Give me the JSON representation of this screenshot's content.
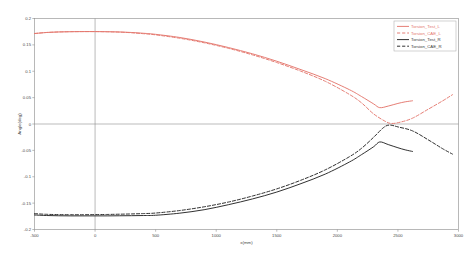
{
  "chart_data": {
    "type": "line",
    "title": "",
    "xlabel": "x(mm)",
    "ylabel": "Angle(deg)",
    "xlim": [
      -500,
      3000
    ],
    "ylim": [
      -0.2,
      0.2
    ],
    "xticks": [
      "-500",
      "0",
      "500",
      "1000",
      "1500",
      "2000",
      "2500",
      "3000"
    ],
    "xtick_values": [
      -500,
      0,
      500,
      1000,
      1500,
      2000,
      2500,
      3000
    ],
    "yticks": [
      "0.2",
      "0.15",
      "0.1",
      "0.05",
      "0",
      "-0.05",
      "-0.1",
      "-0.15",
      "-0.2"
    ],
    "ytick_values": [
      0.2,
      0.15,
      0.1,
      0.05,
      0,
      -0.05,
      -0.1,
      -0.15,
      -0.2
    ],
    "grid": false,
    "legend_position": "top-right",
    "zero_line": true,
    "series": [
      {
        "name": "Torsion_Test_L",
        "color": "#e4776e",
        "style": "solid",
        "x": [
          -500,
          -400,
          -300,
          -200,
          -100,
          0,
          100,
          200,
          300,
          400,
          500,
          700,
          900,
          1100,
          1300,
          1500,
          1700,
          1900,
          2100,
          2200,
          2300,
          2350,
          2420,
          2500,
          2560,
          2620
        ],
        "y": [
          0.1715,
          0.1735,
          0.1745,
          0.175,
          0.1752,
          0.1752,
          0.175,
          0.1745,
          0.1735,
          0.172,
          0.17,
          0.164,
          0.1555,
          0.145,
          0.133,
          0.119,
          0.103,
          0.086,
          0.065,
          0.052,
          0.038,
          0.031,
          0.034,
          0.039,
          0.042,
          0.044
        ]
      },
      {
        "name": "Torsion_CAE_L",
        "color": "#e4776e",
        "style": "dashed",
        "x": [
          -500,
          -400,
          -300,
          -200,
          -100,
          0,
          100,
          200,
          300,
          400,
          500,
          700,
          900,
          1100,
          1300,
          1500,
          1700,
          1900,
          2100,
          2200,
          2300,
          2400,
          2450,
          2520,
          2620,
          2750,
          2870,
          2950
        ],
        "y": [
          0.1715,
          0.1735,
          0.1745,
          0.175,
          0.1752,
          0.1752,
          0.1748,
          0.1742,
          0.173,
          0.1712,
          0.169,
          0.1625,
          0.154,
          0.1435,
          0.131,
          0.1165,
          0.1,
          0.081,
          0.056,
          0.04,
          0.019,
          0.0045,
          0.001,
          0.0035,
          0.011,
          0.028,
          0.044,
          0.0555
        ]
      },
      {
        "name": "Torsion_Test_R",
        "color": "#262626",
        "style": "solid",
        "x": [
          -500,
          -400,
          -300,
          -200,
          -100,
          0,
          100,
          200,
          300,
          400,
          500,
          700,
          900,
          1100,
          1300,
          1500,
          1700,
          1900,
          2100,
          2200,
          2300,
          2350,
          2420,
          2500,
          2560,
          2620
        ],
        "y": [
          -0.1725,
          -0.1735,
          -0.174,
          -0.1742,
          -0.1742,
          -0.1742,
          -0.1742,
          -0.174,
          -0.1738,
          -0.1735,
          -0.173,
          -0.169,
          -0.1625,
          -0.153,
          -0.142,
          -0.129,
          -0.113,
          -0.095,
          -0.072,
          -0.058,
          -0.043,
          -0.034,
          -0.039,
          -0.045,
          -0.049,
          -0.052
        ]
      },
      {
        "name": "Torsion_CAE_R",
        "color": "#262626",
        "style": "dashed",
        "x": [
          -500,
          -400,
          -300,
          -200,
          -100,
          0,
          100,
          200,
          300,
          400,
          500,
          700,
          900,
          1100,
          1300,
          1500,
          1700,
          1900,
          2100,
          2200,
          2300,
          2380,
          2430,
          2500,
          2620,
          2750,
          2870,
          2950
        ],
        "y": [
          -0.17,
          -0.1712,
          -0.1718,
          -0.172,
          -0.172,
          -0.1718,
          -0.1715,
          -0.171,
          -0.1705,
          -0.1698,
          -0.1688,
          -0.164,
          -0.157,
          -0.148,
          -0.1365,
          -0.123,
          -0.1065,
          -0.087,
          -0.062,
          -0.046,
          -0.025,
          -0.007,
          -0.002,
          -0.0055,
          -0.013,
          -0.03,
          -0.047,
          -0.057
        ]
      }
    ]
  },
  "legend": {
    "entries": [
      {
        "label": "Torsion_Test_L"
      },
      {
        "label": "Torsion_CAE_L"
      },
      {
        "label": "Torsion_Test_R"
      },
      {
        "label": "Torsion_CAE_R"
      }
    ]
  },
  "caption": {
    "text": ""
  }
}
